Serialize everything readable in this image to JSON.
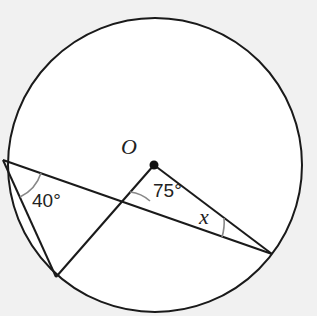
{
  "diagram": {
    "type": "circle-geometry",
    "center_label": "O",
    "angles": [
      {
        "name": "inscribed-angle",
        "label": "40°"
      },
      {
        "name": "central-angle",
        "label": "75°"
      },
      {
        "name": "unknown-angle",
        "label": "x"
      }
    ],
    "colors": {
      "line": "#1a1a1a",
      "arc": "#888888",
      "fill": "#ffffff",
      "background": "#f1f1f1"
    }
  }
}
